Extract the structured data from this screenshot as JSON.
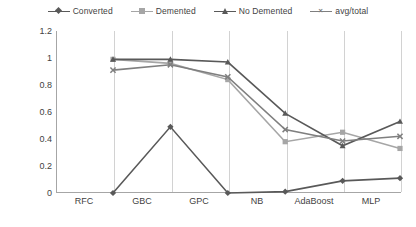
{
  "chart_data": {
    "type": "line",
    "title": "",
    "xlabel": "",
    "ylabel": "",
    "categories": [
      "RFC",
      "GBC",
      "GPC",
      "NB",
      "AdaBoost",
      "MLP"
    ],
    "ylim": [
      0,
      1.2
    ],
    "yticks": [
      "0",
      "0.2",
      "0.4",
      "0.6",
      "0.8",
      "1",
      "1.2"
    ],
    "ytick_values": [
      0,
      0.2,
      0.4,
      0.6,
      0.8,
      1.0,
      1.2
    ],
    "grid": "vertical",
    "legend_position": "top",
    "series": [
      {
        "name": "Converted",
        "color": "#595959",
        "marker": "diamond",
        "values": [
          0,
          0.49,
          0,
          0.01,
          0.09,
          0.11
        ]
      },
      {
        "name": "Demented",
        "color": "#a6a6a6",
        "marker": "square",
        "values": [
          0.99,
          0.96,
          0.84,
          0.38,
          0.45,
          0.33
        ]
      },
      {
        "name": "No Demented",
        "color": "#595959",
        "marker": "triangle",
        "values": [
          0.99,
          0.99,
          0.97,
          0.59,
          0.35,
          0.53
        ]
      },
      {
        "name": "avg/total",
        "color": "#7f7f7f",
        "marker": "x",
        "values": [
          0.91,
          0.95,
          0.86,
          0.47,
          0.385,
          0.42
        ]
      }
    ]
  },
  "legend": {
    "items": [
      {
        "label": "Converted"
      },
      {
        "label": "Demented"
      },
      {
        "label": "No Demented"
      },
      {
        "label": "avg/total"
      }
    ]
  },
  "axes": {
    "y_labels": [
      "1.2",
      "1",
      "0.8",
      "0.6",
      "0.4",
      "0.2",
      "0"
    ],
    "x_labels": [
      "RFC",
      "GBC",
      "GPC",
      "NB",
      "AdaBoost",
      "MLP"
    ]
  },
  "colors": {
    "converted": "#595959",
    "demented": "#a6a6a6",
    "no_demented": "#595959",
    "avg_total": "#7f7f7f",
    "axis": "#a6a6a6",
    "gridline": "#d2d2d2",
    "text": "#3f3f3f"
  }
}
